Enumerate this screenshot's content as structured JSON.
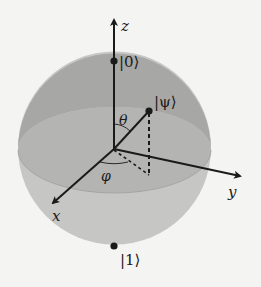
{
  "diagram": {
    "colors": {
      "background": "#f4f4f2",
      "sphere_upper": "#a9a9a7",
      "sphere_lower": "#c6c6c4",
      "equator_band": "#b6b6b4",
      "ink": "#1a1a1a"
    },
    "axes": {
      "z": {
        "label": "z"
      },
      "x": {
        "label": "x"
      },
      "y": {
        "label": "y"
      }
    },
    "states": {
      "zero": {
        "label": "|0⟩"
      },
      "one": {
        "label": "|1⟩"
      },
      "psi": {
        "label": "|ψ⟩"
      }
    },
    "angles": {
      "theta": {
        "label": "θ"
      },
      "phi": {
        "label": "φ"
      }
    }
  }
}
